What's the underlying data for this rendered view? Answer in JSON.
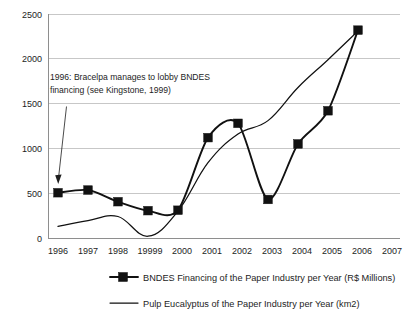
{
  "chart_data": {
    "type": "line",
    "title": "",
    "xlabel": "",
    "ylabel": "",
    "grid": true,
    "legend_position": "bottom",
    "ylim": [
      0,
      2500
    ],
    "yticks": [
      "0",
      "500",
      "1000",
      "1500",
      "2000",
      "2500"
    ],
    "categories": [
      "1996",
      "1997",
      "1998",
      "1999",
      "2000",
      "2001",
      "2002",
      "2003",
      "2004",
      "2005",
      "2006",
      "2007"
    ],
    "xtick_labels": [
      "1996",
      "1997",
      "1998",
      "19999",
      "2000",
      "2001",
      "2002",
      "2003",
      "2004",
      "2005",
      "2006",
      "2007"
    ],
    "series": [
      {
        "name": "BNDES Financing of the Paper Industry per Year (R$ Millions)",
        "marker": "filled-square",
        "line_style": "thick-solid",
        "x": [
          "1996",
          "1997",
          "1998",
          "1999",
          "2000",
          "2001",
          "2002",
          "2003",
          "2004",
          "2005",
          "2006"
        ],
        "values": [
          505,
          535,
          405,
          305,
          310,
          1120,
          1280,
          430,
          1050,
          1420,
          2320
        ]
      },
      {
        "name": "Pulp Eucalyptus of the Paper Industry per Year (km2)",
        "marker": "none",
        "line_style": "thin-solid-smooth",
        "x": [
          "1996",
          "1997",
          "1998",
          "1999",
          "2000",
          "2001",
          "2002",
          "2003",
          "2004",
          "2005",
          "2006"
        ],
        "values": [
          130,
          195,
          240,
          20,
          300,
          840,
          1160,
          1310,
          1680,
          1990,
          2310
        ]
      }
    ],
    "annotations": [
      {
        "id": "bracelpa-note",
        "line1": "1996: Bracelpa manages to lobby BNDES",
        "line2": "financing (see Kingstone, 1999)",
        "points_to": {
          "x": "1996",
          "y": 505
        }
      }
    ]
  },
  "legend": {
    "items": [
      {
        "label": "BNDES Financing of the Paper Industry per Year (R$ Millions)",
        "swatch": "line-with-square-marker"
      },
      {
        "label": "Pulp Eucalyptus of the Paper Industry per Year (km2)",
        "swatch": "plain-line"
      }
    ]
  },
  "colors": {
    "series": "#111111",
    "grid": "#b9b9b9",
    "axis": "#8e8e8e",
    "text": "#1d1d1d",
    "background": "#ffffff"
  }
}
